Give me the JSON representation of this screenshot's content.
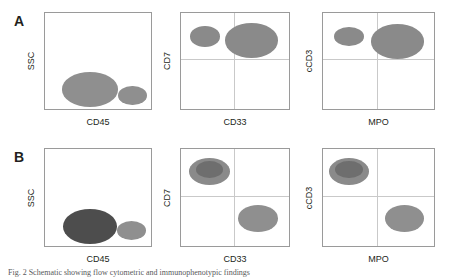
{
  "figure": {
    "panels": [
      {
        "letter": "A",
        "plots": [
          {
            "xlabel": "CD45",
            "ylabel": "SSC",
            "quadrants": false,
            "populations": [
              {
                "name": "blast-population",
                "cx": 0.42,
                "cy": 0.78,
                "rx": 0.26,
                "ry": 0.175,
                "color": "#8f8f8f"
              },
              {
                "name": "lymphocyte-population",
                "cx": 0.81,
                "cy": 0.84,
                "rx": 0.135,
                "ry": 0.1,
                "color": "#8f8f8f"
              }
            ]
          },
          {
            "xlabel": "CD33",
            "ylabel": "CD7",
            "quadrants": true,
            "populations": [
              {
                "name": "cd7-positive-cd33-negative-population",
                "cx": 0.22,
                "cy": 0.24,
                "rx": 0.135,
                "ry": 0.105,
                "color": "#8a8a8a"
              },
              {
                "name": "cd7-positive-cd33-positive-population",
                "cx": 0.64,
                "cy": 0.28,
                "rx": 0.24,
                "ry": 0.175,
                "color": "#8a8a8a"
              }
            ]
          },
          {
            "xlabel": "MPO",
            "ylabel": "cCD3",
            "quadrants": true,
            "populations": [
              {
                "name": "ccd3-positive-mpo-negative-population",
                "cx": 0.23,
                "cy": 0.24,
                "rx": 0.135,
                "ry": 0.1,
                "color": "#8a8a8a"
              },
              {
                "name": "ccd3-positive-mpo-positive-population",
                "cx": 0.66,
                "cy": 0.29,
                "rx": 0.235,
                "ry": 0.175,
                "color": "#8a8a8a"
              }
            ]
          }
        ]
      },
      {
        "letter": "B",
        "plots": [
          {
            "xlabel": "CD45",
            "ylabel": "SSC",
            "quadrants": false,
            "populations": [
              {
                "name": "blast-population",
                "cx": 0.42,
                "cy": 0.78,
                "rx": 0.25,
                "ry": 0.175,
                "color": "#4d4d4d"
              },
              {
                "name": "lymphocyte-population",
                "cx": 0.8,
                "cy": 0.82,
                "rx": 0.135,
                "ry": 0.095,
                "color": "#8f8f8f"
              }
            ]
          },
          {
            "xlabel": "CD33",
            "ylabel": "CD7",
            "quadrants": true,
            "populations": [
              {
                "name": "cd7-positive-cd33-negative-population",
                "cx": 0.26,
                "cy": 0.23,
                "rx": 0.185,
                "ry": 0.135,
                "color": "#8a8a8a",
                "inner": {
                  "name": "inner-core",
                  "cx": 0.26,
                  "cy": 0.205,
                  "rx": 0.125,
                  "ry": 0.085,
                  "color": "#6e6e6e"
                }
              },
              {
                "name": "cd33-positive-cd7-negative-population",
                "cx": 0.7,
                "cy": 0.7,
                "rx": 0.185,
                "ry": 0.135,
                "color": "#8f8f8f"
              }
            ]
          },
          {
            "xlabel": "MPO",
            "ylabel": "cCD3",
            "quadrants": true,
            "populations": [
              {
                "name": "ccd3-positive-mpo-negative-population",
                "cx": 0.23,
                "cy": 0.23,
                "rx": 0.175,
                "ry": 0.135,
                "color": "#8a8a8a",
                "inner": {
                  "name": "inner-core",
                  "cx": 0.23,
                  "cy": 0.205,
                  "rx": 0.12,
                  "ry": 0.085,
                  "color": "#6e6e6e"
                }
              },
              {
                "name": "mpo-positive-ccd3-negative-population",
                "cx": 0.72,
                "cy": 0.7,
                "rx": 0.175,
                "ry": 0.135,
                "color": "#8f8f8f"
              }
            ]
          }
        ]
      }
    ],
    "caption": "Fig. 2  Schematic showing flow cytometric and immunophenotypic findings"
  }
}
